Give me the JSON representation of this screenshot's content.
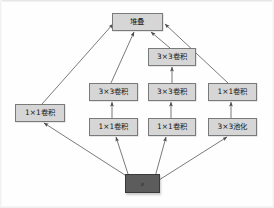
{
  "diagram": {
    "type": "neural-network-architecture",
    "nodes": [
      {
        "id": "stack",
        "label": "堆叠",
        "x": 112,
        "y": 13,
        "w": 51,
        "h": 18,
        "style": "block"
      },
      {
        "id": "conv3x3-b",
        "label": "3×3卷积",
        "x": 148,
        "y": 48,
        "w": 48,
        "h": 18,
        "style": "block"
      },
      {
        "id": "conv3x3-c",
        "label": "3×3卷积",
        "x": 89,
        "y": 83,
        "w": 49,
        "h": 18,
        "style": "block"
      },
      {
        "id": "conv3x3-d",
        "label": "3×3卷积",
        "x": 148,
        "y": 83,
        "w": 48,
        "h": 18,
        "style": "block"
      },
      {
        "id": "conv1x1-e",
        "label": "1×1卷积",
        "x": 208,
        "y": 83,
        "w": 49,
        "h": 18,
        "style": "block"
      },
      {
        "id": "conv1x1-f",
        "label": "1×1卷积",
        "x": 89,
        "y": 118,
        "w": 49,
        "h": 18,
        "style": "block"
      },
      {
        "id": "conv1x1-g",
        "label": "1×1卷积",
        "x": 148,
        "y": 118,
        "w": 48,
        "h": 18,
        "style": "block"
      },
      {
        "id": "pool3x3",
        "label": "3×3池化",
        "x": 208,
        "y": 118,
        "w": 49,
        "h": 18,
        "style": "block"
      },
      {
        "id": "conv1x1-a",
        "label": "1×1卷积",
        "x": 15,
        "y": 104,
        "w": 50,
        "h": 18,
        "style": "block"
      },
      {
        "id": "input-x",
        "label": "x",
        "x": 125,
        "y": 174,
        "w": 35,
        "h": 19,
        "style": "input"
      }
    ],
    "edges": [
      {
        "from": "conv1x1-a",
        "to": "stack",
        "d": "M 42,104 L 113,24"
      },
      {
        "from": "conv3x3-c",
        "to": "stack",
        "d": "M 111,83 L 134,32"
      },
      {
        "from": "conv3x3-b",
        "to": "stack",
        "d": "M 170,48 L 151,32"
      },
      {
        "from": "conv1x1-e",
        "to": "stack",
        "d": "M 228,83 L 165,24"
      },
      {
        "from": "conv3x3-d",
        "to": "conv3x3-b",
        "d": "M 172,83 L 172,67"
      },
      {
        "from": "conv1x1-f",
        "to": "conv3x3-c",
        "d": "M 112,118 L 112,102"
      },
      {
        "from": "conv1x1-g",
        "to": "conv3x3-d",
        "d": "M 171,118 L 171,102"
      },
      {
        "from": "pool3x3",
        "to": "conv1x1-e",
        "d": "M 231,118 L 231,102"
      },
      {
        "from": "input-x",
        "to": "conv1x1-a",
        "d": "M 128,177 L 44,123"
      },
      {
        "from": "input-x",
        "to": "conv1x1-f",
        "d": "M 129,177 L 116,137"
      },
      {
        "from": "input-x",
        "to": "conv1x1-g",
        "d": "M 155,177 L 166,137"
      },
      {
        "from": "input-x",
        "to": "pool3x3",
        "d": "M 159,180 L 227,137"
      }
    ],
    "colors": {
      "node_fill": "#d6d6d6",
      "node_border": "#7a7a7a",
      "input_fill": "#5c5c5c",
      "input_border": "#3a3a3a",
      "edge": "#6b6b6b",
      "background": "#fefefe"
    }
  }
}
